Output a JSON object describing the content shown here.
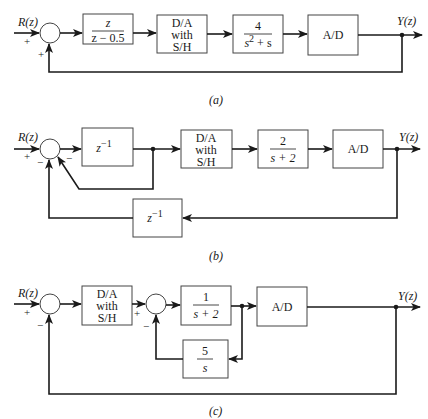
{
  "diagrams": {
    "a": {
      "caption": "(a)",
      "input_label": "R(z)",
      "output_label": "Y(z)",
      "summer_signs": {
        "input": "+",
        "feedback": "+"
      },
      "blocks": [
        {
          "id": "controller",
          "num": "z",
          "den": "z − 0.5"
        },
        {
          "id": "dac",
          "lines": [
            "D/A",
            "with",
            "S/H"
          ]
        },
        {
          "id": "plant",
          "num": "4",
          "den_base": "s",
          "den_exp": "2",
          "den_rest": " + s"
        },
        {
          "id": "adc",
          "label": "A/D"
        }
      ]
    },
    "b": {
      "caption": "(b)",
      "input_label": "R(z)",
      "output_label": "Y(z)",
      "summer_signs": {
        "input": "+",
        "inner_feedback": "−",
        "outer_feedback": "−"
      },
      "blocks": [
        {
          "id": "delay_forward",
          "base": "z",
          "exp": "−1"
        },
        {
          "id": "dac",
          "lines": [
            "D/A",
            "with",
            "S/H"
          ]
        },
        {
          "id": "plant",
          "num": "2",
          "den": "s + 2"
        },
        {
          "id": "adc",
          "label": "A/D"
        },
        {
          "id": "delay_feedback",
          "base": "z",
          "exp": "−1"
        }
      ]
    },
    "c": {
      "caption": "(c)",
      "input_label": "R(z)",
      "output_label": "Y(z)",
      "summer1_signs": {
        "input": "+",
        "feedback": "−"
      },
      "summer2_signs": {
        "input": "+",
        "feedback": "−"
      },
      "blocks": [
        {
          "id": "dac",
          "lines": [
            "D/A",
            "with",
            "S/H"
          ]
        },
        {
          "id": "plant",
          "num": "1",
          "den": "s + 2"
        },
        {
          "id": "adc",
          "label": "A/D"
        },
        {
          "id": "integrator_feedback",
          "num": "5",
          "den": "s"
        }
      ]
    }
  }
}
